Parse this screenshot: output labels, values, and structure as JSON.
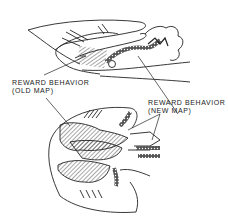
{
  "figure": {
    "views": [
      "sagittal-section",
      "horizontal-section"
    ],
    "labels": {
      "old_map": {
        "line1": "REWARD BEHAVIOR",
        "line2": "(OLD MAP)"
      },
      "new_map": {
        "line1": "REWARD BEHAVIOR",
        "line2": "(NEW MAP)"
      }
    },
    "colors": {
      "ink": "#222222",
      "background": "#ffffff"
    }
  }
}
